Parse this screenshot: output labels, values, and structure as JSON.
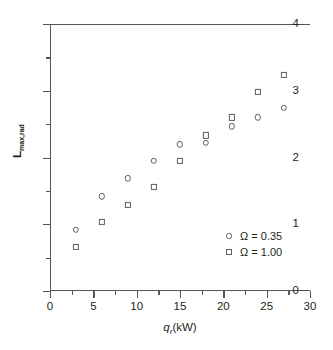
{
  "chart_data": {
    "type": "scatter",
    "title": "",
    "xlabel": "q_r (kW)",
    "xlabel_parts": {
      "symbol": "q",
      "subscript": "r",
      "unit": "(kW)"
    },
    "ylabel": "L_max,rad",
    "ylabel_parts": {
      "symbol": "L",
      "subscript": "max,rad"
    },
    "xlim": [
      0,
      30
    ],
    "ylim": [
      0,
      4
    ],
    "grid": false,
    "legend_position": "lower-right-inside",
    "xticks": [
      0,
      5,
      10,
      15,
      20,
      25,
      30
    ],
    "xtick_labels": [
      "0",
      "5",
      "10",
      "15",
      "20",
      "25",
      "30"
    ],
    "xminor_step": 2.5,
    "yticks": [
      0,
      1,
      2,
      3,
      4
    ],
    "ytick_labels": [
      "0",
      "1",
      "2",
      "3",
      "4"
    ],
    "yminor_step": 0.5,
    "marker_color": "#5b5d62",
    "axis_color": "#55565a",
    "series": [
      {
        "name": "Ω = 0.35",
        "marker": "open-circle",
        "x": [
          3,
          6,
          9,
          12,
          15,
          18,
          21,
          24,
          27
        ],
        "values": [
          0.92,
          1.42,
          1.69,
          1.95,
          2.2,
          2.22,
          2.47,
          2.6,
          2.74
        ]
      },
      {
        "name": "Ω = 1.00",
        "marker": "open-square",
        "x": [
          3,
          6,
          9,
          12,
          15,
          18,
          21,
          24,
          27
        ],
        "values": [
          0.66,
          1.04,
          1.29,
          1.56,
          1.95,
          2.33,
          2.6,
          2.98,
          3.24
        ]
      }
    ]
  },
  "legend": {
    "entries": [
      {
        "label": "Ω = 0.35",
        "marker": "open-circle"
      },
      {
        "label": "Ω = 1.00",
        "marker": "open-square"
      }
    ]
  }
}
